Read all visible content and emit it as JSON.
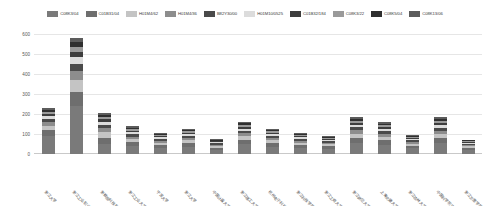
{
  "chart_data": {
    "type": "bar",
    "stacked": true,
    "title": "",
    "subtitle": "",
    "xlabel": "",
    "ylabel": "",
    "ylim": [
      0,
      600
    ],
    "yticks": [
      0,
      100,
      200,
      300,
      400,
      500,
      600
    ],
    "ytick_labels": [
      "0",
      "100",
      "200",
      "300",
      "400",
      "500",
      "600"
    ],
    "grid": true,
    "legend_position": "top-center",
    "categories": [
      "浙江大学",
      "浙江工业职业技术学院",
      "浙数据科技职业技术学院",
      "浙江工业大学",
      "宁波大学",
      "浙江大学",
      "中国计量大学",
      "浙江理工大学",
      "杭州电子科技大学",
      "浙江科技学院",
      "浙江工商大学",
      "浙江师范大学",
      "上海交通大学",
      "浙江农林大学",
      "中国科学院宁波材料技术与工程研究所",
      "浙江万里学院"
    ],
    "series": [
      {
        "name": "C08K3/04",
        "color": "#7a7a7a",
        "values": [
          92,
          240,
          52,
          41,
          30,
          36,
          22,
          48,
          36,
          30,
          26,
          55,
          46,
          28,
          54,
          20
        ]
      },
      {
        "name": "C01B31/04",
        "color": "#6e6e6e",
        "values": [
          28,
          72,
          30,
          20,
          14,
          18,
          10,
          22,
          18,
          14,
          12,
          26,
          22,
          14,
          26,
          10
        ]
      },
      {
        "name": "H01M4/62",
        "color": "#c4c4c4",
        "values": [
          22,
          58,
          26,
          14,
          12,
          14,
          8,
          18,
          14,
          12,
          10,
          20,
          18,
          10,
          20,
          8
        ]
      },
      {
        "name": "H01M4/36",
        "color": "#8d8d8d",
        "values": [
          18,
          44,
          20,
          12,
          10,
          12,
          7,
          15,
          12,
          10,
          8,
          17,
          15,
          9,
          17,
          7
        ]
      },
      {
        "name": "B82Y30/00",
        "color": "#4a4a4a",
        "values": [
          16,
          38,
          18,
          11,
          9,
          10,
          6,
          13,
          10,
          9,
          7,
          15,
          13,
          8,
          15,
          6
        ]
      },
      {
        "name": "H01M10/0525",
        "color": "#dcdcdc",
        "values": [
          14,
          32,
          15,
          10,
          8,
          9,
          5,
          11,
          9,
          8,
          6,
          13,
          11,
          7,
          13,
          5
        ]
      },
      {
        "name": "C01B32/184",
        "color": "#3d3d3d",
        "values": [
          12,
          28,
          13,
          9,
          7,
          8,
          5,
          10,
          8,
          7,
          6,
          11,
          10,
          6,
          11,
          5
        ]
      },
      {
        "name": "C08K3/22",
        "color": "#9a9a9a",
        "values": [
          10,
          24,
          11,
          8,
          6,
          7,
          4,
          9,
          7,
          6,
          5,
          10,
          9,
          5,
          10,
          4
        ]
      },
      {
        "name": "C08K5/04",
        "color": "#2f2f2f",
        "values": [
          9,
          22,
          10,
          7,
          6,
          6,
          4,
          8,
          6,
          6,
          5,
          9,
          8,
          5,
          9,
          4
        ]
      },
      {
        "name": "C08K13/06",
        "color": "#5c5c5c",
        "values": [
          8,
          20,
          9,
          6,
          5,
          6,
          4,
          7,
          6,
          5,
          4,
          8,
          7,
          4,
          8,
          3
        ]
      }
    ]
  },
  "colors": {
    "background": "#ffffff",
    "gridline": "#e6e6e6",
    "axis": "#c9c9c9",
    "tick_text": "#555555",
    "legend_text": "#3a3a3a"
  }
}
